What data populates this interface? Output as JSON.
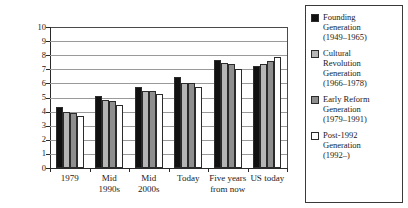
{
  "chart_data": {
    "type": "bar",
    "title": "",
    "xlabel": "",
    "ylabel": "Level of Democracy",
    "ylim": [
      0,
      10
    ],
    "ytick_labels": [
      "0",
      "1",
      "2",
      "3",
      "4",
      "5",
      "6",
      "7",
      "8",
      "9",
      "10"
    ],
    "grid": true,
    "legend_position": "right",
    "categories": [
      "1979",
      "Mid\n1990s",
      "Mid\n2000s",
      "Today",
      "Five years\nfrom now",
      "US today"
    ],
    "series": [
      {
        "name": "Founding Generation (1949–1965)",
        "color": "#111111",
        "values": [
          4.3,
          5.1,
          5.75,
          6.45,
          7.65,
          7.2
        ]
      },
      {
        "name": "Cultural Revolution Generation (1966–1978)",
        "color": "#b6b6b6",
        "values": [
          4.0,
          4.85,
          5.45,
          6.05,
          7.45,
          7.4
        ]
      },
      {
        "name": "Early Reform Generation (1979–1991)",
        "color": "#8e8e8e",
        "values": [
          3.9,
          4.75,
          5.45,
          6.0,
          7.35,
          7.6
        ]
      },
      {
        "name": "Post-1992 Generation (1992–)",
        "color": "#ffffff",
        "values": [
          3.7,
          4.5,
          5.25,
          5.75,
          7.05,
          7.9
        ]
      }
    ]
  },
  "legend": {
    "items": [
      {
        "swatch": "legend-swatch-founding",
        "label": "Founding\nGeneration\n(1949–1965)"
      },
      {
        "swatch": "legend-swatch-cultural-revolution",
        "label": "Cultural\nRevolution\nGeneration\n(1966–1978)"
      },
      {
        "swatch": "legend-swatch-early-reform",
        "label": "Early Reform\nGeneration\n(1979–1991)"
      },
      {
        "swatch": "legend-swatch-post-1992",
        "label": "Post-1992\nGeneration\n(1992–)"
      }
    ]
  }
}
